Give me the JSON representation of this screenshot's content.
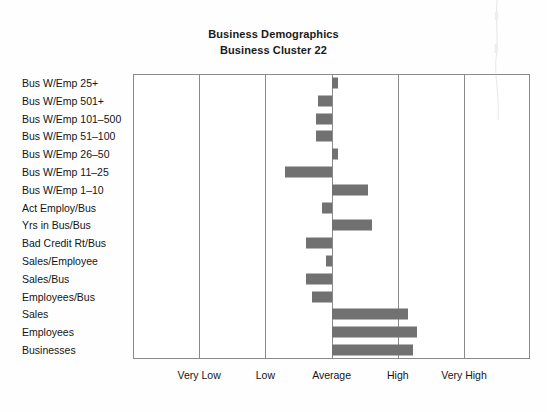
{
  "chart_data": {
    "type": "bar",
    "orientation": "horizontal",
    "title": "Business Demographics",
    "subtitle": "Business Cluster 22",
    "xlabel": "",
    "ylabel": "",
    "grid": true,
    "legend": false,
    "baseline_category": "Average",
    "xtick_labels": [
      "Very Low",
      "Low",
      "Average",
      "High",
      "Very High"
    ],
    "xtick_values": [
      -2,
      -1,
      0,
      1,
      2
    ],
    "xlim": [
      -3,
      3
    ],
    "bar_color": "#717171",
    "categories": [
      "Bus W/Emp 25+",
      "Bus W/Emp 501+",
      "Bus W/Emp 101–500",
      "Bus W/Emp 51–100",
      "Bus W/Emp 26–50",
      "Bus W/Emp 11–25",
      "Bus W/Emp 1–10",
      "Act Employ/Bus",
      "Yrs in Bus/Bus",
      "Bad Credit Rt/Bus",
      "Sales/Employee",
      "Sales/Bus",
      "Employees/Bus",
      "Sales",
      "Employees",
      "Businesses"
    ],
    "values": [
      0.09,
      -0.2,
      -0.24,
      -0.23,
      0.09,
      -0.7,
      0.55,
      -0.15,
      0.61,
      -0.38,
      -0.08,
      -0.38,
      -0.29,
      1.15,
      1.29,
      1.23
    ]
  },
  "axis": {
    "ticks": [
      {
        "label": "Very Low",
        "value": -2
      },
      {
        "label": "Low",
        "value": -1
      },
      {
        "label": "Average",
        "value": 0
      },
      {
        "label": "High",
        "value": 1
      },
      {
        "label": "Very High",
        "value": 2
      }
    ]
  }
}
